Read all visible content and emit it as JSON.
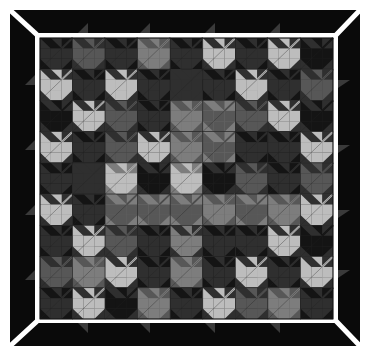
{
  "image": {
    "subject": "Maple leaf quilt in grayscale with black mitred border",
    "width": 369,
    "height": 356
  },
  "palette": {
    "K": "#141414",
    "D": "#2f2f2f",
    "M": "#575757",
    "G": "#7d7d7d",
    "L": "#bdbdbd",
    "frame": "#0a0a0a",
    "line": "#ffffff",
    "seam": "#222222"
  },
  "frame": {
    "outer": [
      10,
      10,
      360,
      346
    ],
    "inner_white": [
      35,
      33,
      338,
      323
    ],
    "grid": [
      40,
      38,
      333,
      319
    ]
  },
  "grid": {
    "rows": 9,
    "cols": 9,
    "leaves": [
      [
        "D",
        "M",
        "D",
        "G",
        "D",
        "L",
        "D",
        "L",
        "K"
      ],
      [
        "L",
        "D",
        "L",
        "D",
        "D",
        "D",
        "L",
        "D",
        "M"
      ],
      [
        "K",
        "L",
        "M",
        "D",
        "G",
        "M",
        "M",
        "L",
        "K"
      ],
      [
        "L",
        "D",
        "M",
        "L",
        "G",
        "M",
        "D",
        "D",
        "L"
      ],
      [
        "D",
        "D",
        "L",
        "K",
        "L",
        "K",
        "M",
        "D",
        "M"
      ],
      [
        "L",
        "D",
        "M",
        "M",
        "M",
        "G",
        "M",
        "G",
        "L"
      ],
      [
        "D",
        "L",
        "M",
        "D",
        "G",
        "D",
        "D",
        "L",
        "K"
      ],
      [
        "M",
        "G",
        "L",
        "D",
        "G",
        "D",
        "L",
        "D",
        "L"
      ],
      [
        "D",
        "L",
        "K",
        "G",
        "D",
        "L",
        "M",
        "G",
        "D"
      ]
    ],
    "backgrounds": [
      [
        "K",
        "D",
        "K",
        "M",
        "K",
        "D",
        "K",
        "D",
        "D"
      ],
      [
        "D",
        "K",
        "D",
        "K",
        "D",
        "K",
        "D",
        "K",
        "D"
      ],
      [
        "D",
        "D",
        "D",
        "K",
        "M",
        "G",
        "D",
        "D",
        "D"
      ],
      [
        "D",
        "K",
        "D",
        "D",
        "M",
        "G",
        "K",
        "K",
        "D"
      ],
      [
        "K",
        "D",
        "G",
        "D",
        "G",
        "D",
        "D",
        "K",
        "D"
      ],
      [
        "D",
        "K",
        "G",
        "G",
        "G",
        "M",
        "G",
        "M",
        "D"
      ],
      [
        "K",
        "D",
        "D",
        "K",
        "D",
        "K",
        "K",
        "D",
        "D"
      ],
      [
        "D",
        "M",
        "D",
        "K",
        "M",
        "K",
        "D",
        "K",
        "D"
      ],
      [
        "K",
        "D",
        "D",
        "M",
        "K",
        "D",
        "D",
        "M",
        "K"
      ]
    ]
  }
}
